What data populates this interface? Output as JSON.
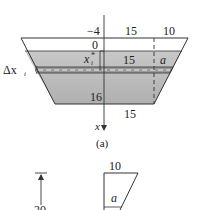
{
  "figure_a": {
    "caption": "(a)",
    "labels": {
      "top_neg4": "−4",
      "top_15": "15",
      "top_10": "10",
      "water_0": "0",
      "xi_star": "x",
      "xi_star_sup": "*",
      "xi_star_sub": "i",
      "mid_15": "15",
      "mid_a": "a",
      "delta_x": "Δx",
      "delta_x_sub": "i",
      "bottom_16": "16",
      "below_15": "15",
      "axis_x": "x"
    },
    "colors": {
      "water_fill": "#bdbdbd",
      "band_fill": "#9e9e9e",
      "stroke": "#333333"
    }
  },
  "figure_b": {
    "labels": {
      "top_10": "10",
      "inner_a": "a",
      "height_20": "20"
    }
  }
}
